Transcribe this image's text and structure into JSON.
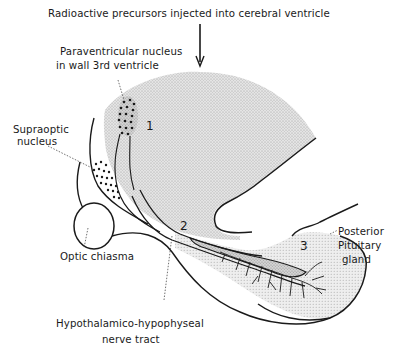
{
  "figure": {
    "labels": {
      "top": "Radioactive precursors injected into cerebral ventricle",
      "paraventricular_line1": "Paraventricular nucleus",
      "paraventricular_line2": "in wall 3rd ventricle",
      "supraoptic_line1": "Supraoptic",
      "supraoptic_line2": "nucleus",
      "optic_chiasma": "Optic chiasma",
      "posterior_line1": "Posterior",
      "posterior_line2": "Pituitary",
      "posterior_line3": "gland",
      "tract_line1": "Hypothalamico-hypophyseal",
      "tract_line2": "nerve tract"
    },
    "markers": {
      "m1": "1",
      "m2": "2",
      "m3": "3"
    },
    "colors": {
      "ink": "#1a1a1a",
      "stipple_dark": "#c9c9c9",
      "stipple_light": "#dedede",
      "background": "#ffffff"
    }
  }
}
